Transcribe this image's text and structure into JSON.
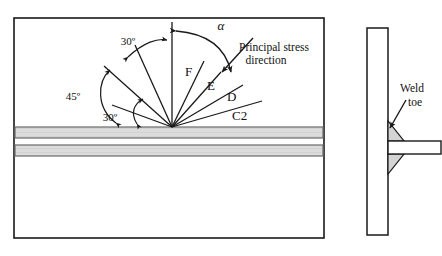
{
  "figure": {
    "type": "engineering-diagram"
  },
  "left_panel": {
    "name": "crack-angle-fan-panel",
    "frame": {
      "x": 14,
      "y": 18,
      "width": 310,
      "height": 220
    },
    "apex": {
      "x": 172,
      "y": 127
    },
    "bands": [
      {
        "label": "weld-band-upper",
        "y": 127,
        "height": 11,
        "fill": "#d9d9d9"
      },
      {
        "label": "weld-band-lower",
        "y": 145,
        "height": 11,
        "fill": "#d9d9d9"
      }
    ],
    "rays": [
      {
        "id": "vertical-reference",
        "angle_deg": 0,
        "label": ""
      },
      {
        "id": "ray-F",
        "angle_deg": 18,
        "label": "F"
      },
      {
        "id": "ray-E",
        "angle_deg": 33,
        "label": "E"
      },
      {
        "id": "ray-D",
        "angle_deg": 48,
        "label": "D"
      },
      {
        "id": "ray-C2",
        "angle_deg": 63,
        "label": "C2"
      },
      {
        "id": "ray-left-a",
        "angle_deg": -30,
        "label": ""
      },
      {
        "id": "ray-left-b",
        "angle_deg": -50,
        "label": ""
      },
      {
        "id": "ray-left-c",
        "angle_deg": -72,
        "label": ""
      }
    ],
    "labels": {
      "alpha": "α",
      "F": "F",
      "E": "E",
      "D": "D",
      "C2": "C2",
      "angle_top": "30º",
      "angle_mid": "45º",
      "angle_low": "30º",
      "principal_stress_line1": "Principal stress",
      "principal_stress_line2": "direction"
    }
  },
  "right_panel": {
    "name": "weld-toe-detail-panel",
    "vertical_plate": {
      "x": 367,
      "y": 28,
      "width": 21,
      "height": 207
    },
    "horizontal_plate": {
      "x": 388,
      "y": 141,
      "width": 53,
      "height": 13
    },
    "fillets": [
      {
        "id": "fillet-upper",
        "fill": "#d4d4d4"
      },
      {
        "id": "fillet-lower",
        "fill": "#d4d4d4"
      }
    ],
    "labels": {
      "weld_line1": "Weld",
      "weld_line2": "toe"
    }
  },
  "colors": {
    "stroke": "#1a1a1a",
    "band_fill": "#d9d9d9",
    "fillet_fill": "#d4d4d4",
    "background": "#ffffff"
  }
}
